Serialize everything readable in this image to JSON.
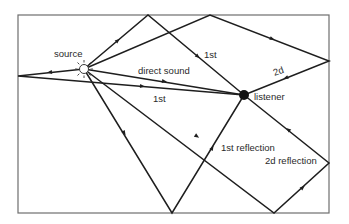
{
  "diagram": {
    "colors": {
      "background": "#ffffff",
      "ray": "#1e1e1e",
      "wall": "#6e6e6e",
      "text": "#2a2a2a"
    },
    "room": {
      "x1": 18,
      "y1": 15,
      "x2": 329,
      "y2": 213
    },
    "source": {
      "x": 84,
      "y": 69,
      "r": 4.5
    },
    "listener": {
      "x": 244,
      "y": 95,
      "r": 5
    },
    "labels": {
      "source": "source",
      "listener": "listener",
      "direct_sound": "direct sound",
      "first_top": "1st",
      "first_left": "1st",
      "second_top": "2d",
      "first_reflection": "1st reflection",
      "second_reflection": "2d reflection"
    },
    "rays": [
      {
        "name": "direct-sound",
        "points": [
          [
            84,
            69
          ],
          [
            244,
            95
          ]
        ]
      },
      {
        "name": "first-reflection-top",
        "points": [
          [
            84,
            69
          ],
          [
            148,
            15
          ],
          [
            244,
            95
          ]
        ]
      },
      {
        "name": "second-reflection-top-right",
        "points": [
          [
            84,
            69
          ],
          [
            210,
            15
          ],
          [
            329,
            61
          ],
          [
            244,
            95
          ]
        ]
      },
      {
        "name": "first-reflection-left",
        "points": [
          [
            84,
            69
          ],
          [
            18,
            76
          ],
          [
            244,
            95
          ]
        ]
      },
      {
        "name": "first-reflection-bottom",
        "points": [
          [
            84,
            69
          ],
          [
            172,
            213
          ],
          [
            244,
            95
          ]
        ]
      },
      {
        "name": "second-reflection-bottom-right",
        "points": [
          [
            84,
            69
          ],
          [
            274,
            213
          ],
          [
            329,
            163
          ],
          [
            244,
            95
          ]
        ]
      }
    ]
  }
}
